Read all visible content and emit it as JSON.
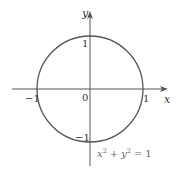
{
  "diagram": {
    "type": "unit-circle",
    "equation": {
      "x_term": "x",
      "plus": "+",
      "y_term": "y",
      "exponent": "2",
      "equals": "=",
      "rhs": "1"
    },
    "axes": {
      "x_label": "x",
      "y_label": "y",
      "origin_label": "0"
    },
    "ticks": {
      "x_pos": "1",
      "x_neg": "−1",
      "y_pos": "1",
      "y_neg": "−1"
    },
    "colors": {
      "stroke": "#555555",
      "text": "#333333",
      "equation_text": "#666666"
    }
  }
}
